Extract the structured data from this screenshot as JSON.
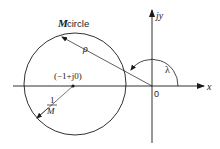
{
  "diagram": {
    "title_label": {
      "bold": "M",
      "rest": " circle"
    },
    "radius_label": "ρ",
    "center_label": "(−1+j0)",
    "offset_label": {
      "num": "1",
      "den": "M"
    },
    "origin_label": "0",
    "x_axis_label": "x",
    "y_axis_label": "jy",
    "angle_label": "λ",
    "colors": {
      "stroke": "#1a1a1a",
      "background": "#ffffff"
    }
  }
}
